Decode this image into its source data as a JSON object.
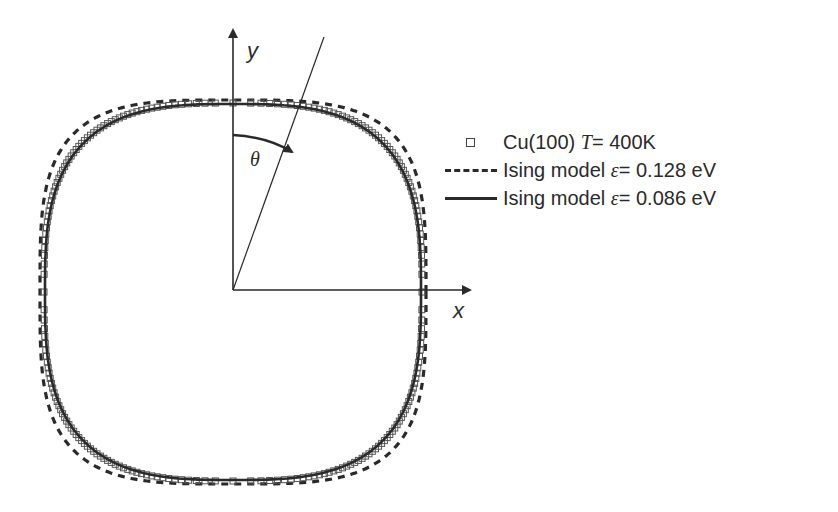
{
  "figure": {
    "axes": {
      "x_label": "x",
      "y_label": "y",
      "angle_label": "θ"
    },
    "legend": [
      {
        "symbol": "open-square",
        "text_prefix": "Cu(100) ",
        "var": "T",
        "text_suffix": " = 400K"
      },
      {
        "symbol": "dashed-line",
        "text_prefix": "Ising model ",
        "var": "ε",
        "text_suffix": " = 0.128 eV"
      },
      {
        "symbol": "solid-line",
        "text_prefix": "Ising model ",
        "var": "ε",
        "text_suffix": " = 0.086 eV"
      }
    ],
    "colors": {
      "ink": "#2a2a2a",
      "markers": "#555555",
      "background": "#ffffff"
    }
  }
}
